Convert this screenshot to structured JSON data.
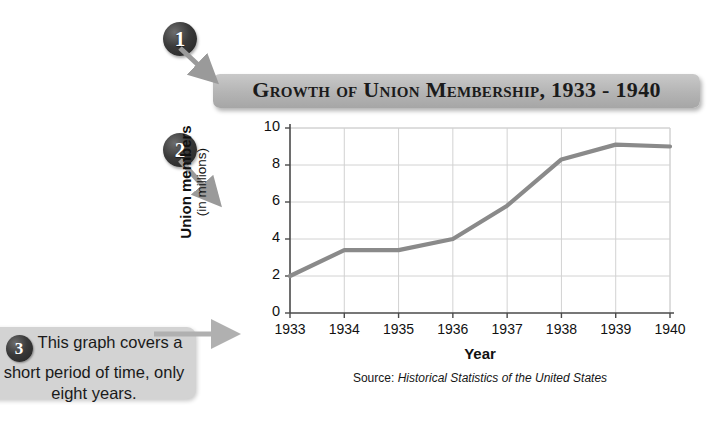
{
  "title_banner": {
    "text": "Growth of Union Membership, 1933 - 1940"
  },
  "markers": {
    "one": "1",
    "two": "2",
    "three": "3"
  },
  "callout": {
    "text": "This graph covers a short period of time, only eight years."
  },
  "chart_data": {
    "type": "line",
    "title": "Growth of Union Membership, 1933 - 1940",
    "xlabel": "Year",
    "ylabel": "Union members (in millions)",
    "ylabel_main": "Union members",
    "ylabel_sub": "(in millions)",
    "source_prefix": "Source:",
    "source_title": "Historical Statistics of the United States",
    "categories": [
      "1933",
      "1934",
      "1935",
      "1936",
      "1937",
      "1938",
      "1939",
      "1940"
    ],
    "values": [
      2.0,
      3.4,
      3.4,
      4.0,
      5.8,
      8.3,
      9.1,
      9.0
    ],
    "yticks": [
      "0",
      "2",
      "4",
      "6",
      "8",
      "10"
    ],
    "ytick_values": [
      0,
      2,
      4,
      6,
      8,
      10
    ],
    "ylim": [
      0,
      10
    ],
    "grid": true,
    "legend": "none",
    "line_color": "#8a8a8a",
    "grid_color": "#d2d2d2",
    "axis_color": "#4a4a4a"
  },
  "colors": {
    "banner_top": "#c9c9c9",
    "banner_bottom": "#a6a6a6",
    "callout_bg": "#d3d3d3",
    "marker_fill": "#2b2b2b",
    "arrow_gray": "#9a9a9a",
    "text": "#1a1a1a"
  }
}
